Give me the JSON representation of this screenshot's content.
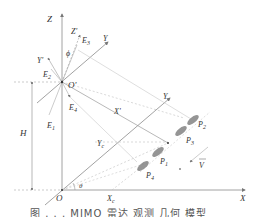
{
  "diagram": {
    "axes_ground": {
      "origin": "O",
      "x": "X",
      "y": "Y",
      "z": "Z"
    },
    "axes_radar": {
      "origin": "O'",
      "x": "X'",
      "y": "Y'",
      "z": "Z'"
    },
    "labels": {
      "H": "H",
      "theta": "θ",
      "phi": "ϕ",
      "Xc": "X",
      "Xc_sub": "c",
      "Yc": "Y",
      "Yc_sub": "c",
      "E1": "E",
      "E1_sub": "1",
      "E2": "E",
      "E2_sub": "2",
      "E3": "E",
      "E3_sub": "3",
      "E4": "E",
      "E4_sub": "4",
      "P1": "P",
      "P1_sub": "1",
      "P2": "P",
      "P2_sub": "2",
      "P3": "P",
      "P3_sub": "3",
      "P4": "P",
      "P4_sub": "4",
      "V": "V"
    },
    "caption": "图 . . . MIMO 雷达 观测 几何 模型"
  },
  "colors": {
    "axis": "#8a8a8a",
    "dashed": "#b5b5b5",
    "text": "#333333",
    "vehicle": "#6e6e6e"
  }
}
